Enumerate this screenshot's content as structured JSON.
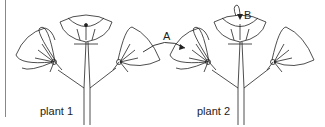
{
  "diagram": {
    "type": "pollination-diagram",
    "plants": [
      {
        "label": "plant 1",
        "flowers": 3
      },
      {
        "label": "plant 2",
        "flowers": 3
      }
    ],
    "arrows": [
      {
        "label": "A",
        "from": "plant 1 right flower",
        "to": "plant 2 left flower",
        "meaning": "cross-pollination"
      },
      {
        "label": "B",
        "from": "plant 2 middle flower anther",
        "to": "plant 2 middle flower stigma",
        "meaning": "self-pollination"
      }
    ],
    "colors": {
      "line": "#222222",
      "background": "#ffffff"
    }
  }
}
